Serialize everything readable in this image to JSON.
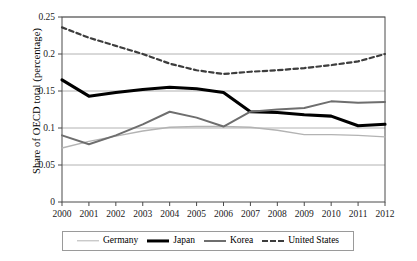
{
  "chart_data": {
    "type": "line",
    "title": "",
    "xlabel": "",
    "ylabel": "Share of OECD total (percentage)",
    "x": [
      2000,
      2001,
      2002,
      2003,
      2004,
      2005,
      2006,
      2007,
      2008,
      2009,
      2010,
      2011,
      2012
    ],
    "xtick_labels": [
      "2000",
      "2001",
      "2002",
      "2003",
      "2004",
      "2005",
      "2006",
      "2007",
      "2008",
      "2009",
      "2010",
      "2011",
      "2012"
    ],
    "ytick_labels": [
      "0",
      "0.05",
      "0.1",
      "0.15",
      "0.2",
      "0.25"
    ],
    "yticks": [
      0,
      0.05,
      0.1,
      0.15,
      0.2,
      0.25
    ],
    "ylim": [
      0,
      0.25
    ],
    "xlim": [
      2000,
      2012
    ],
    "grid": "horizontal",
    "legend_position": "bottom",
    "series": [
      {
        "name": "Germany",
        "color": "#b3b3b3",
        "style": "solid",
        "width": 1.4,
        "values": [
          0.073,
          0.082,
          0.089,
          0.096,
          0.101,
          0.102,
          0.102,
          0.101,
          0.097,
          0.091,
          0.091,
          0.09,
          0.088
        ]
      },
      {
        "name": "Japan",
        "color": "#000000",
        "style": "solid",
        "width": 3.1,
        "values": [
          0.165,
          0.143,
          0.148,
          0.152,
          0.155,
          0.153,
          0.148,
          0.122,
          0.121,
          0.118,
          0.116,
          0.103,
          0.105
        ]
      },
      {
        "name": "Korea",
        "color": "#6e6e6e",
        "style": "solid",
        "width": 2.0,
        "values": [
          0.09,
          0.078,
          0.09,
          0.105,
          0.122,
          0.114,
          0.102,
          0.122,
          0.125,
          0.127,
          0.136,
          0.134,
          0.135
        ]
      },
      {
        "name": "United States",
        "color": "#3d3d3d",
        "style": "dashed",
        "width": 2.2,
        "values": [
          0.236,
          0.222,
          0.211,
          0.2,
          0.187,
          0.178,
          0.173,
          0.176,
          0.178,
          0.181,
          0.185,
          0.19,
          0.2
        ]
      }
    ]
  },
  "legend": {
    "items": [
      {
        "label": "Germany"
      },
      {
        "label": "Japan"
      },
      {
        "label": "Korea"
      },
      {
        "label": "United States"
      }
    ]
  },
  "axis": {
    "y_title": "Share of OECD total (percentage)"
  }
}
